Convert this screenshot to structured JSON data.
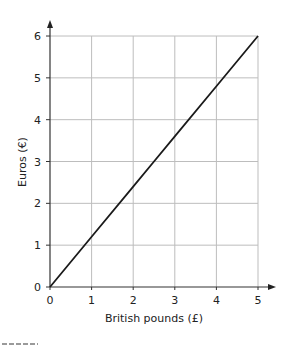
{
  "chart_data": {
    "type": "line",
    "title": "",
    "xlabel": "British pounds (£)",
    "ylabel": "Euros (€)",
    "xlim": [
      0,
      5
    ],
    "ylim": [
      0,
      6
    ],
    "x_ticks": [
      "0",
      "1",
      "2",
      "3",
      "4",
      "5"
    ],
    "y_ticks": [
      "0",
      "1",
      "2",
      "3",
      "4",
      "5",
      "6"
    ],
    "grid": true,
    "legend": null,
    "series": [
      {
        "name": "Conversion line",
        "x": [
          0,
          1,
          2,
          2.5,
          3,
          4,
          5
        ],
        "y": [
          0,
          1.2,
          2.4,
          3,
          3.6,
          4.8,
          6
        ],
        "color": "#1a1a1a"
      }
    ]
  },
  "layout": {
    "origin_px": [
      50,
      287
    ],
    "x_step_px": 41.6,
    "y_step_px": 41.83,
    "grid_color": "#bdbdbd",
    "axis_color": "#333333"
  }
}
